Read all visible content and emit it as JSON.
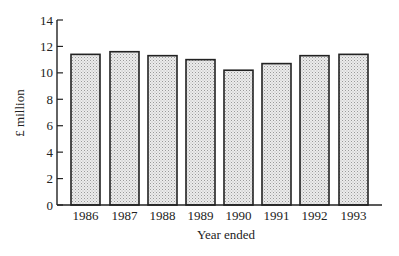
{
  "chart_data": {
    "type": "bar",
    "title": "",
    "xlabel": "Year ended",
    "ylabel": "£ million",
    "categories": [
      "1986",
      "1987",
      "1988",
      "1989",
      "1990",
      "1991",
      "1992",
      "1993"
    ],
    "values": [
      11.4,
      11.6,
      11.3,
      11.0,
      10.2,
      10.7,
      11.3,
      11.4
    ],
    "ylim": [
      0,
      14
    ],
    "yticks": [
      0,
      2,
      4,
      6,
      8,
      10,
      12,
      14
    ],
    "grid": false,
    "legend": null,
    "bar_fill": "stippled light grey",
    "bar_stroke": "#222222"
  },
  "colors": {
    "bar_fill": "#e4e4e4",
    "bar_dot": "#9a9a9a",
    "stroke": "#222222",
    "background": "#ffffff"
  }
}
